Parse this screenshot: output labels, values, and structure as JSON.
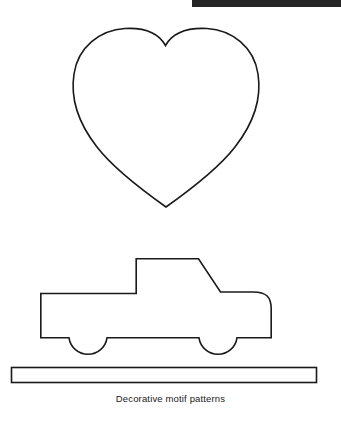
{
  "page": {
    "width": 341,
    "height": 430,
    "background_color": "#ffffff",
    "ink_color": "#1a1a1a"
  },
  "top_bar": {
    "label": "",
    "color": "#262626",
    "x": 192,
    "y": 0,
    "width": 149,
    "height": 7
  },
  "figure": {
    "caption": "Decorative motif patterns",
    "motifs": [
      {
        "name": "heart",
        "label": "heart",
        "stroke_color": "#1a1a1a",
        "fill": "none",
        "bounds": {
          "x": 73,
          "y": 28,
          "width": 185,
          "height": 179
        },
        "notch": {
          "x": 165,
          "y": 45
        },
        "tip": {
          "x": 166,
          "y": 207
        }
      },
      {
        "name": "pickup-truck",
        "label": "pickup truck",
        "stroke_color": "#1a1a1a",
        "fill": "none",
        "bounds": {
          "x": 40,
          "y": 258,
          "width": 232,
          "height": 99
        },
        "cab_roof": {
          "x1": 136,
          "x2": 198,
          "y": 258
        },
        "wheels": [
          {
            "name": "rear-wheel-arch",
            "cx": 88,
            "cy": 338,
            "r": 19
          },
          {
            "name": "front-wheel-arch",
            "cx": 218,
            "cy": 338,
            "r": 19
          }
        ]
      },
      {
        "name": "ground-bar",
        "label": "ground bar",
        "stroke_color": "#1a1a1a",
        "fill": "none",
        "bounds": {
          "x": 11,
          "y": 367,
          "width": 306,
          "height": 16
        }
      }
    ]
  }
}
